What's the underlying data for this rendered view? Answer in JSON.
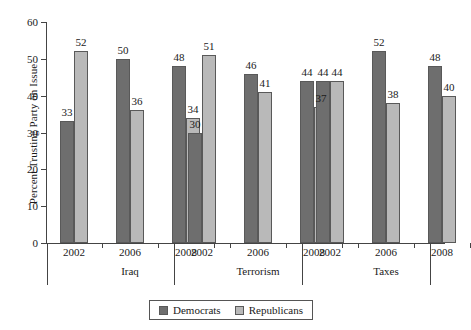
{
  "chart_data": {
    "type": "bar",
    "title": "",
    "xlabel": "",
    "ylabel": "Percent Trusting Party on Issue",
    "ylim": [
      0,
      60
    ],
    "yticks": [
      0,
      10,
      20,
      30,
      40,
      50,
      60
    ],
    "grid": false,
    "legend_position": "bottom-center",
    "categories": [
      "Iraq 2002",
      "Iraq 2006",
      "Iraq 2008",
      "Terrorism 2002",
      "Terrorism 2006",
      "Terrorism 2008",
      "Taxes 2002",
      "Taxes 2006",
      "Taxes 2008"
    ],
    "groups": [
      {
        "name": "Iraq",
        "years": [
          "2002",
          "2006",
          "2008"
        ]
      },
      {
        "name": "Terrorism",
        "years": [
          "2002",
          "2006",
          "2008"
        ]
      },
      {
        "name": "Taxes",
        "years": [
          "2002",
          "2006",
          "2008"
        ]
      }
    ],
    "series": [
      {
        "name": "Democrats",
        "color": "#6e6e6e",
        "values": [
          33,
          50,
          48,
          30,
          46,
          44,
          44,
          52,
          48
        ]
      },
      {
        "name": "Republicans",
        "color": "#b9b9b9",
        "values": [
          52,
          36,
          34,
          51,
          41,
          37,
          44,
          38,
          40
        ]
      }
    ],
    "data_labels": [
      {
        "group": "Iraq",
        "year": "2002",
        "Democrats": 33,
        "Republicans": 52
      },
      {
        "group": "Iraq",
        "year": "2006",
        "Democrats": 50,
        "Republicans": 36
      },
      {
        "group": "Iraq",
        "year": "2008",
        "Democrats": 48,
        "Republicans": 34
      },
      {
        "group": "Terrorism",
        "year": "2002",
        "Democrats": 30,
        "Republicans": 51
      },
      {
        "group": "Terrorism",
        "year": "2006",
        "Democrats": 46,
        "Republicans": 41
      },
      {
        "group": "Terrorism",
        "year": "2008",
        "Democrats": 44,
        "Republicans": 37
      },
      {
        "group": "Taxes",
        "year": "2002",
        "Democrats": 44,
        "Republicans": 44
      },
      {
        "group": "Taxes",
        "year": "2006",
        "Democrats": 52,
        "Republicans": 38
      },
      {
        "group": "Taxes",
        "year": "2008",
        "Democrats": 48,
        "Republicans": 40
      }
    ]
  },
  "legend": {
    "items": [
      {
        "label": "Democrats",
        "color": "#6e6e6e"
      },
      {
        "label": "Republicans",
        "color": "#b9b9b9"
      }
    ]
  },
  "axis": {
    "y_title": "Percent Trusting Party on Issue",
    "y_tick_labels": [
      "0",
      "10",
      "20",
      "30",
      "40",
      "50",
      "60"
    ]
  }
}
